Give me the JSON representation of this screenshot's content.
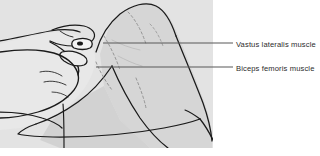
{
  "figure": {
    "name": "knee-palpation-illustration",
    "background_color": "#ffffff",
    "plate_color": "#dcdcdc",
    "skin_shade_color": "#d8d8d8",
    "line_color": "#1a1a1a",
    "leader_line_color": "#585858",
    "label_text_color": "#2b2b2b"
  },
  "callouts": [
    {
      "id": "vastus-lateralis",
      "label": "Vastus lateralis muscle",
      "leader_y": 43,
      "leader_x_start": 103,
      "leader_x_end": 233
    },
    {
      "id": "biceps-femoris",
      "label": "Biceps femoris muscle",
      "leader_y": 67,
      "leader_x_start": 96,
      "leader_x_end": 233
    }
  ]
}
